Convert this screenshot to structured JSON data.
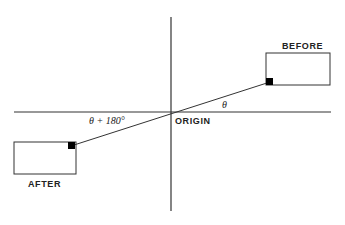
{
  "diagram": {
    "title": "",
    "labels": {
      "before": "BEFORE",
      "after": "AFTER",
      "origin": "ORIGIN",
      "angle": "θ",
      "angle_plus": "θ + 180°"
    },
    "colors": {
      "line": "#333333",
      "marker": "#000000",
      "background": "#ffffff"
    },
    "elements": {
      "x_axis": {
        "x1": 14,
        "y1": 112,
        "x2": 331,
        "y2": 112
      },
      "y_axis": {
        "x1": 171,
        "y1": 17,
        "x2": 171,
        "y2": 211
      },
      "before_box": {
        "x": 266,
        "y": 53,
        "w": 64,
        "h": 32
      },
      "after_box": {
        "x": 14,
        "y": 142,
        "w": 62,
        "h": 32
      },
      "connector": {
        "x1": 74,
        "y1": 145,
        "x2": 270,
        "y2": 82
      }
    }
  }
}
